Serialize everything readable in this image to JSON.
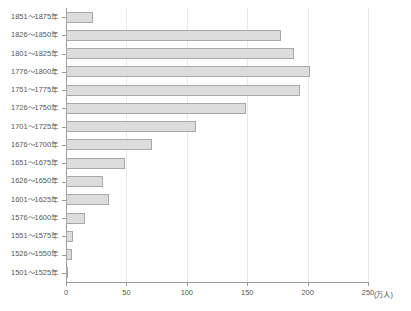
{
  "chart_data": {
    "type": "bar",
    "orientation": "horizontal",
    "title": "",
    "xlabel": "(万人)",
    "ylabel": "",
    "xlim": [
      0,
      250
    ],
    "ylim": null,
    "grid": "vertical",
    "legend": null,
    "xticks": [
      "0",
      "50",
      "100",
      "150",
      "200",
      "250"
    ],
    "xtick_values": [
      0,
      50,
      100,
      150,
      200,
      250
    ],
    "categories": [
      "1851〜1875年",
      "1826〜1850年",
      "1801〜1825年",
      "1776〜1800年",
      "1751〜1775年",
      "1726〜1750年",
      "1701〜1725年",
      "1676〜1700年",
      "1651〜1675年",
      "1626〜1650年",
      "1601〜1625年",
      "1576〜1600年",
      "1551〜1575年",
      "1526〜1550年",
      "1501〜1525年"
    ],
    "values": [
      22,
      178,
      189,
      202,
      194,
      149,
      108,
      71,
      49,
      31,
      36,
      16,
      6,
      5,
      2
    ],
    "bar_color": "#dcdcdc",
    "bar_border_color": "#a8a8a8",
    "axis_color": "#9a9a9a",
    "grid_color": "#e9e9e9",
    "text_color": "#555555"
  }
}
